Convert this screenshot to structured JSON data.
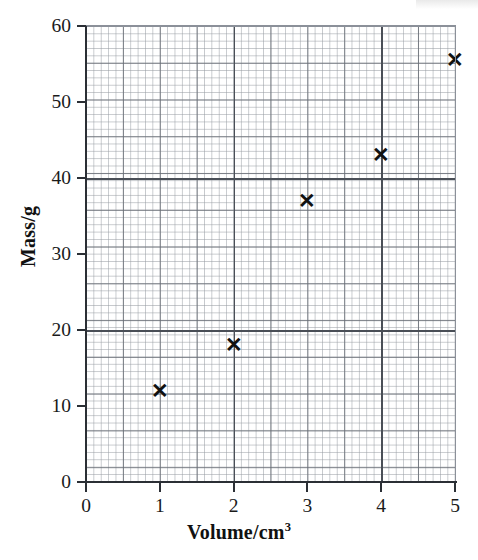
{
  "chart_data": {
    "type": "scatter",
    "title": "",
    "xlabel": "Volume/cm3",
    "xlabel_base": "Volume/cm",
    "xlabel_exponent": "3",
    "ylabel": "Mass/g",
    "x": [
      1,
      2,
      3,
      4,
      5
    ],
    "values": [
      12,
      18,
      37,
      43,
      55.5
    ],
    "series": [
      {
        "name": "Mass vs Volume",
        "points": [
          {
            "x": 1,
            "y": 12
          },
          {
            "x": 2,
            "y": 18
          },
          {
            "x": 3,
            "y": 37
          },
          {
            "x": 4,
            "y": 43
          },
          {
            "x": 5,
            "y": 55.5
          }
        ]
      }
    ],
    "xlim": [
      0,
      5
    ],
    "ylim": [
      0,
      60
    ],
    "x_ticks": [
      "0",
      "1",
      "2",
      "3",
      "4",
      "5"
    ],
    "x_tick_values": [
      0,
      1,
      2,
      3,
      4,
      5
    ],
    "y_ticks": [
      "0",
      "10",
      "20",
      "30",
      "40",
      "50",
      "60"
    ],
    "y_tick_values": [
      0,
      10,
      20,
      30,
      40,
      50,
      60
    ],
    "grid": true,
    "grid_style": "graph-paper minor grid with darker major lines",
    "major_gridlines_x": [
      2,
      4
    ],
    "major_gridlines_y": [
      20,
      40
    ],
    "legend": null,
    "legend_position": "none",
    "marker_symbol": "✕",
    "marker_color": "#111111",
    "axis_color": "#2b2f35",
    "grid_color": "#969ba2",
    "background_color": "#ffffff"
  },
  "axis": {
    "x_tick_labels": [
      "0",
      "1",
      "2",
      "3",
      "4",
      "5"
    ],
    "y_tick_labels": [
      "0",
      "10",
      "20",
      "30",
      "40",
      "50",
      "60"
    ]
  },
  "markers": {
    "glyph": "✕"
  }
}
